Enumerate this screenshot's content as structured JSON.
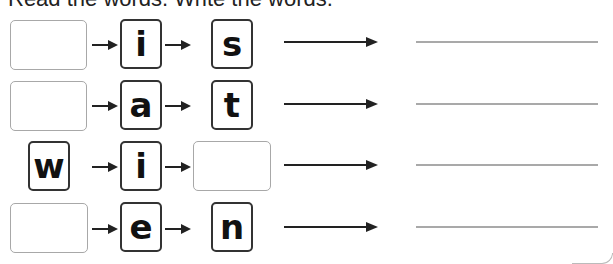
{
  "instructions": "Read the words. Write the words.",
  "rows": [
    {
      "slots": [
        "",
        "i",
        "s"
      ],
      "blank_index": 0,
      "answer": ""
    },
    {
      "slots": [
        "",
        "a",
        "t"
      ],
      "blank_index": 0,
      "answer": ""
    },
    {
      "slots": [
        "w",
        "i",
        ""
      ],
      "blank_index": 2,
      "answer": ""
    },
    {
      "slots": [
        "",
        "e",
        "n"
      ],
      "blank_index": 0,
      "answer": ""
    }
  ],
  "colors": {
    "letter_border": "#333333",
    "blank_border": "#a8a8a8",
    "write_line": "#a9a9a9",
    "arrow": "#222222"
  }
}
